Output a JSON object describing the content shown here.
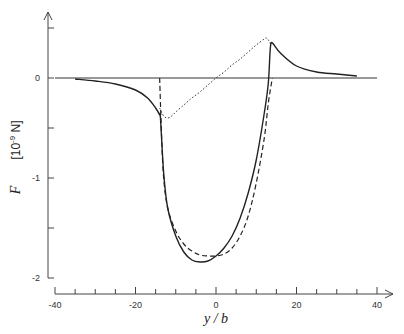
{
  "chart_data": {
    "type": "line",
    "title": "",
    "xlabel": "y / b",
    "ylabel": "F",
    "ylabel_unit": "[10-9 N]",
    "ylabel_unit_base": "[10",
    "ylabel_unit_exp": "-9",
    "ylabel_unit_tail": " N]",
    "xlim": [
      -40,
      40
    ],
    "ylim": [
      -2,
      0.5
    ],
    "x_ticks": [
      -40,
      -20,
      0,
      20,
      40
    ],
    "x_tick_labels": [
      "-40",
      "-20",
      "0",
      "20",
      "40"
    ],
    "x_minor_step": 5,
    "y_ticks": [
      0,
      -1,
      -2
    ],
    "y_tick_labels": [
      "0",
      "-1",
      "-2"
    ],
    "y_minor_step": 0.5,
    "grid": false,
    "legend": null,
    "zero_line": {
      "x_from": -40,
      "x_to": 40
    },
    "series": [
      {
        "name": "solid",
        "style": "solid",
        "x": [
          -35,
          -30,
          -25,
          -20,
          -17,
          -15,
          -14,
          -13.8,
          -13,
          -12,
          -10,
          -8,
          -6,
          -4,
          -2,
          0,
          2,
          4,
          6,
          8,
          10,
          12,
          13,
          13.5,
          14,
          16,
          20,
          25,
          30,
          35
        ],
        "y": [
          -0.01,
          -0.03,
          -0.06,
          -0.12,
          -0.2,
          -0.3,
          -0.37,
          -0.4,
          -0.95,
          -1.3,
          -1.58,
          -1.74,
          -1.82,
          -1.84,
          -1.83,
          -1.78,
          -1.7,
          -1.58,
          -1.4,
          -1.15,
          -0.82,
          -0.35,
          -0.05,
          0.3,
          0.35,
          0.25,
          0.12,
          0.06,
          0.04,
          0.02
        ]
      },
      {
        "name": "dashed",
        "style": "dashed",
        "x": [
          -14,
          -13.5,
          -13,
          -12,
          -10,
          -8,
          -6,
          -4,
          -2,
          0,
          2,
          4,
          6,
          8,
          10,
          12,
          13,
          14
        ],
        "y": [
          0,
          -0.6,
          -1.0,
          -1.3,
          -1.53,
          -1.66,
          -1.73,
          -1.77,
          -1.78,
          -1.78,
          -1.76,
          -1.7,
          -1.58,
          -1.38,
          -1.05,
          -0.6,
          -0.25,
          0
        ]
      },
      {
        "name": "dotted",
        "style": "dotted",
        "x": [
          -14,
          -13,
          -12,
          -11,
          -10,
          -8,
          -6,
          -4,
          -2,
          0,
          2,
          4,
          6,
          8,
          10,
          12,
          12.5,
          13,
          13.8
        ],
        "y": [
          -0.3,
          -0.38,
          -0.4,
          -0.38,
          -0.34,
          -0.27,
          -0.2,
          -0.14,
          -0.07,
          0,
          0.06,
          0.13,
          0.19,
          0.26,
          0.33,
          0.39,
          0.4,
          0.38,
          0.32
        ]
      }
    ]
  },
  "plot": {
    "px_left": 54,
    "px_right": 376,
    "px_zero_x": 216,
    "px_per_unit_x": 4.025,
    "px_zero_y": 78,
    "px_per_unit_y": 100,
    "y_axis_px": 48,
    "x_axis_px": 294
  }
}
